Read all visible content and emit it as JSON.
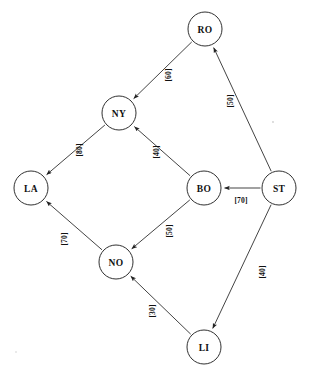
{
  "diagram": {
    "type": "directed-network-graph",
    "title": "",
    "nodes": [
      {
        "id": "RO",
        "label": "RO",
        "x": 205,
        "y": 29,
        "r": 17
      },
      {
        "id": "NY",
        "label": "NY",
        "x": 119,
        "y": 113,
        "r": 17
      },
      {
        "id": "LA",
        "label": "LA",
        "x": 31,
        "y": 188,
        "r": 17
      },
      {
        "id": "BO",
        "label": "BO",
        "x": 204,
        "y": 188,
        "r": 17
      },
      {
        "id": "ST",
        "label": "ST",
        "x": 279,
        "y": 188,
        "r": 17
      },
      {
        "id": "NO",
        "label": "NO",
        "x": 116,
        "y": 262,
        "r": 17
      },
      {
        "id": "LI",
        "label": "LI",
        "x": 204,
        "y": 347,
        "r": 17
      }
    ],
    "edges": [
      {
        "from": "ST",
        "to": "RO",
        "weight": 50,
        "label": "[50]",
        "label_x": 230,
        "label_y": 101,
        "label_rotation": -90
      },
      {
        "from": "RO",
        "to": "NY",
        "weight": 60,
        "label": "[60]",
        "label_x": 168,
        "label_y": 75,
        "label_rotation": -90
      },
      {
        "from": "NY",
        "to": "LA",
        "weight": 80,
        "label": "[80]",
        "label_x": 79,
        "label_y": 150,
        "label_rotation": -90
      },
      {
        "from": "BO",
        "to": "NY",
        "weight": 40,
        "label": "[40]",
        "label_x": 156,
        "label_y": 152,
        "label_rotation": -90
      },
      {
        "from": "ST",
        "to": "BO",
        "weight": 70,
        "label": "[70]",
        "label_x": 241,
        "label_y": 200,
        "label_rotation": 0
      },
      {
        "from": "BO",
        "to": "NO",
        "weight": 50,
        "label": "[50]",
        "label_x": 169,
        "label_y": 231,
        "label_rotation": -90
      },
      {
        "from": "NO",
        "to": "LA",
        "weight": 70,
        "label": "[70]",
        "label_x": 64,
        "label_y": 239,
        "label_rotation": -90
      },
      {
        "from": "ST",
        "to": "LI",
        "weight": 40,
        "label": "[40]",
        "label_x": 262,
        "label_y": 272,
        "label_rotation": -90
      },
      {
        "from": "LI",
        "to": "NO",
        "weight": 30,
        "label": "[30]",
        "label_x": 152,
        "label_y": 311,
        "label_rotation": -90
      }
    ],
    "colors": {
      "node_stroke": "#1a1a1a",
      "node_fill": "#ffffff",
      "edge_stroke": "#222222",
      "text": "#111111",
      "background": "#ffffff"
    }
  }
}
